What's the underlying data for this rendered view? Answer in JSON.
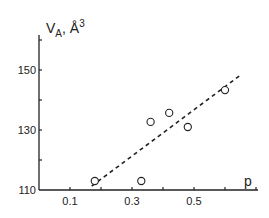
{
  "chart_data": {
    "type": "scatter",
    "title": "",
    "xlabel": "p",
    "ylabel": "V_A, Å^3",
    "ylabel_main": "V",
    "ylabel_sub": "A",
    "ylabel_unit": "Å",
    "ylabel_sup": "3",
    "xlim": [
      0.0,
      0.7
    ],
    "ylim": [
      110,
      160
    ],
    "x_ticks": [
      0.1,
      0.2,
      0.3,
      0.4,
      0.5,
      0.6,
      0.7
    ],
    "x_tick_labels": [
      "0.1",
      "0.3",
      "0.5"
    ],
    "x_tick_label_values": [
      0.1,
      0.3,
      0.5
    ],
    "y_ticks": [
      110,
      120,
      130,
      140,
      150,
      160
    ],
    "y_tick_labels": [
      "110",
      "130",
      "150"
    ],
    "y_tick_label_values": [
      110,
      130,
      150
    ],
    "grid": false,
    "series": [
      {
        "name": "data",
        "marker": "open-circle",
        "x": [
          0.18,
          0.33,
          0.36,
          0.42,
          0.48,
          0.6
        ],
        "y": [
          113,
          113,
          132.7,
          135.7,
          131,
          143.3
        ]
      },
      {
        "name": "fit",
        "style": "dashed-line",
        "x": [
          0.17,
          0.65
        ],
        "y": [
          111.3,
          148.3
        ]
      }
    ]
  }
}
